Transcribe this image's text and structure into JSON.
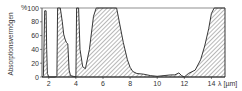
{
  "chart_data": {
    "type": "area",
    "title": "",
    "xlabel": "λ [µm]",
    "ylabel": "Absorptionsvermögen",
    "y_unit": "%",
    "xlim": [
      1.5,
      15
    ],
    "ylim": [
      0,
      100
    ],
    "x_ticks": [
      2,
      4,
      6,
      8,
      10,
      12,
      14
    ],
    "y_ticks": [
      0,
      20,
      40,
      60,
      80,
      100
    ],
    "grid": false,
    "legend": null,
    "fill": "hatched",
    "series": [
      {
        "name": "Absorptionsvermögen",
        "x": [
          1.5,
          1.6,
          1.7,
          1.8,
          1.85,
          1.9,
          2.0,
          2.05,
          2.1,
          2.5,
          2.6,
          2.65,
          2.7,
          2.8,
          2.85,
          3.0,
          3.1,
          3.2,
          3.3,
          3.4,
          3.5,
          3.6,
          3.8,
          4.0,
          4.05,
          4.1,
          4.2,
          4.3,
          4.5,
          4.7,
          5.0,
          5.3,
          5.5,
          6.0,
          7.0,
          7.5,
          7.8,
          8.0,
          8.2,
          8.5,
          9.0,
          9.5,
          10.0,
          10.5,
          11.0,
          11.3,
          11.6,
          11.8,
          12.0,
          12.3,
          12.8,
          13.2,
          13.5,
          13.8,
          14.0,
          14.2,
          15.0
        ],
        "y": [
          0,
          2,
          96,
          96,
          40,
          5,
          0,
          0,
          0,
          0,
          2,
          100,
          100,
          100,
          100,
          80,
          62,
          55,
          50,
          48,
          10,
          2,
          1,
          0,
          100,
          100,
          100,
          40,
          15,
          12,
          40,
          88,
          100,
          100,
          100,
          50,
          25,
          14,
          8,
          5,
          4,
          2,
          1,
          2,
          3,
          3,
          6,
          2,
          0,
          5,
          10,
          25,
          45,
          70,
          92,
          100,
          100
        ]
      }
    ]
  },
  "axis": {
    "y_unit_label": "%",
    "x_unit_label": "λ [µm]",
    "y_title": "Absorptionsvermögen",
    "y_tick_labels": [
      "0",
      "20",
      "40",
      "60",
      "80",
      "100"
    ],
    "x_tick_labels": [
      "2",
      "4",
      "6",
      "8",
      "10",
      "12",
      "14"
    ]
  }
}
